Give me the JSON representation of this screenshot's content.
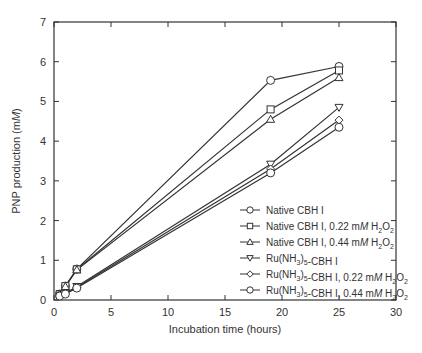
{
  "chart_data": {
    "type": "line",
    "title": "",
    "xlabel": "Incubation time (hours)",
    "ylabel": "PNP production (mM)",
    "ylabel_parts": {
      "prefix": "PNP production (m",
      "italic": "M",
      "suffix": ")"
    },
    "xlim": [
      0,
      30
    ],
    "ylim": [
      0,
      7
    ],
    "x_ticks": [
      0,
      5,
      10,
      15,
      20,
      25,
      30
    ],
    "y_ticks": [
      0,
      1,
      2,
      3,
      4,
      5,
      6,
      7
    ],
    "grid": false,
    "legend_position": "lower right",
    "series": [
      {
        "name": "Native CBH I",
        "marker": "circle",
        "x": [
          0.5,
          1,
          2,
          19,
          25
        ],
        "y": [
          0.15,
          0.35,
          0.78,
          5.53,
          5.88
        ]
      },
      {
        "name": "Native CBH I, 0.22 mM H2O2",
        "marker": "square",
        "x": [
          0.5,
          1,
          2,
          19,
          25
        ],
        "y": [
          0.15,
          0.35,
          0.77,
          4.8,
          5.78
        ]
      },
      {
        "name": "Native CBH I, 0.44 mM H2O2",
        "marker": "triangle-up",
        "x": [
          0.5,
          1,
          2,
          19,
          25
        ],
        "y": [
          0.15,
          0.34,
          0.76,
          4.55,
          5.6
        ]
      },
      {
        "name": "Ru(NH3)5-CBH I",
        "marker": "triangle-down",
        "x": [
          0.5,
          1,
          2,
          19,
          25
        ],
        "y": [
          0.12,
          0.17,
          0.34,
          3.42,
          4.85
        ]
      },
      {
        "name": "Ru(NH3)5-CBH I, 0.22 mM H2O2",
        "marker": "diamond",
        "x": [
          0.5,
          1,
          2,
          19,
          25
        ],
        "y": [
          0.11,
          0.16,
          0.32,
          3.3,
          4.53
        ]
      },
      {
        "name": "Ru(NH3)5-CBH I, 0.44 mM H2O2",
        "marker": "circle",
        "x": [
          0.5,
          1,
          2,
          19,
          25
        ],
        "y": [
          0.1,
          0.15,
          0.3,
          3.2,
          4.35
        ]
      }
    ]
  },
  "legend": [
    {
      "label": "Native CBH I",
      "sub": ""
    },
    {
      "label": "Native CBH I, 0.22 mM H2O2",
      "sub": ""
    },
    {
      "label": "Native CBH I, 0.44 mM H2O2",
      "sub": ""
    },
    {
      "label": "Ru(NH3)5-CBH I",
      "sub": ""
    },
    {
      "label": "Ru(NH3)5-CBH I, 0.22 mM H2O2",
      "sub": ""
    },
    {
      "label": "Ru(NH3)5-CBH I, 0.44 mM H2O2",
      "sub": ""
    }
  ],
  "colors": {
    "line": "#333333",
    "marker_fill": "#ffffff",
    "frame": "#333333"
  }
}
